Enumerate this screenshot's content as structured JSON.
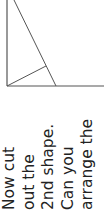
{
  "diagram": {
    "line_color": "#555555",
    "lines": [
      {
        "name": "left-edge",
        "x1": 7,
        "y1": 0,
        "x2": 7,
        "y2": 86
      },
      {
        "name": "base-edge",
        "x1": 7,
        "y1": 86,
        "x2": 104,
        "y2": 86
      },
      {
        "name": "diagonal-cut",
        "x1": 14,
        "y1": 0,
        "x2": 56,
        "y2": 86
      },
      {
        "name": "perpendicular-segment",
        "x1": 7,
        "y1": 86,
        "x2": 46,
        "y2": 66
      }
    ]
  },
  "instructions": {
    "lines": [
      "Now cut",
      "out the",
      "2nd shape.",
      "Can you",
      "arrange the"
    ]
  }
}
